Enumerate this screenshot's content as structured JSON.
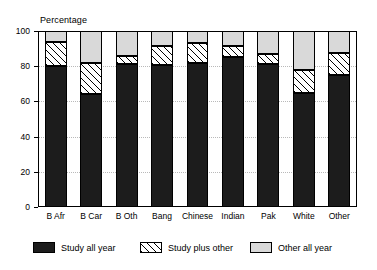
{
  "chart_data": {
    "type": "bar",
    "stacked": true,
    "title": "",
    "subtitle": "",
    "xlabel": "",
    "ylabel": "Percentage",
    "ylim": [
      0,
      100
    ],
    "yticks": [
      0,
      20,
      40,
      60,
      80,
      100
    ],
    "grid": true,
    "legend_position": "bottom",
    "categories": [
      "B Afr",
      "B Car",
      "B Oth",
      "Bang",
      "Chinese",
      "Indian",
      "Pak",
      "White",
      "Other"
    ],
    "series": [
      {
        "name": "Study all year",
        "fill": "solid-dark",
        "color": "#1c1c1c",
        "values": [
          80,
          64,
          81,
          80.5,
          82,
          85,
          81,
          65,
          75
        ]
      },
      {
        "name": "Study plus other",
        "fill": "diagonal-hatch",
        "color": "#ffffff",
        "values": [
          13.5,
          18,
          5,
          11,
          11,
          6.5,
          6,
          13,
          12.5
        ]
      },
      {
        "name": "Other all year",
        "fill": "solid-light-gray",
        "color": "#d9d9d9",
        "values": [
          6.5,
          18,
          14,
          8.5,
          7,
          8.5,
          13,
          22,
          12.5
        ]
      }
    ],
    "cumulative_tops": {
      "study_all_year": [
        80,
        64,
        81,
        80.5,
        82,
        85,
        81,
        65,
        75
      ],
      "plus_study_plus_other": [
        93.5,
        82,
        86,
        91.5,
        93,
        91.5,
        87,
        78,
        87.5
      ],
      "total": [
        100,
        100,
        100,
        100,
        100,
        100,
        100,
        100,
        100
      ]
    }
  },
  "axis": {
    "y_title": "Percentage",
    "y_tick_labels": [
      "0",
      "20",
      "40",
      "60",
      "80",
      "100"
    ]
  },
  "legend": {
    "items": [
      {
        "label": "Study all year",
        "swatch": "solid-dark-swatch"
      },
      {
        "label": "Study plus other",
        "swatch": "diagonal-hatch-swatch"
      },
      {
        "label": "Other all year",
        "swatch": "light-gray-swatch"
      }
    ]
  },
  "colors": {
    "study_all_year": "#1c1c1c",
    "study_plus_other": "#ffffff",
    "other_all_year": "#d9d9d9",
    "axis": "#000000",
    "grid": "#b9b9b9"
  }
}
